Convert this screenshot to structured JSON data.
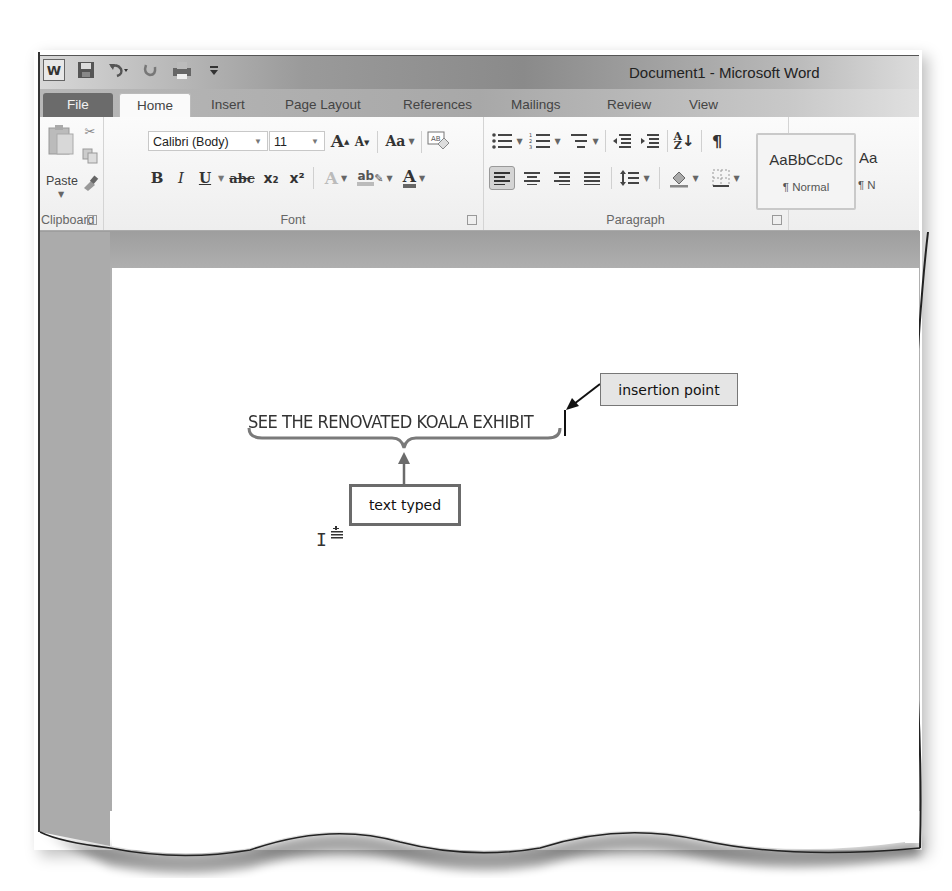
{
  "window": {
    "title": "Document1 - Microsoft Word",
    "quick_access": [
      "word-logo",
      "save",
      "undo",
      "redo",
      "print-preview",
      "customize"
    ],
    "word_logo_letter": "W"
  },
  "tabs": [
    {
      "label": "File",
      "active": false
    },
    {
      "label": "Home",
      "active": true
    },
    {
      "label": "Insert",
      "active": false
    },
    {
      "label": "Page Layout",
      "active": false
    },
    {
      "label": "References",
      "active": false
    },
    {
      "label": "Mailings",
      "active": false
    },
    {
      "label": "Review",
      "active": false
    },
    {
      "label": "View",
      "active": false
    }
  ],
  "ribbon": {
    "clipboard": {
      "label": "Clipboard",
      "paste_label": "Paste",
      "icons": [
        "cut",
        "copy",
        "format-painter"
      ]
    },
    "font": {
      "label": "Font",
      "font_name": "Calibri (Body)",
      "font_size": "11",
      "grow_font": "A",
      "shrink_font": "A",
      "change_case": "Aa",
      "bold": "B",
      "italic": "I",
      "underline": "U",
      "strikethrough": "abc",
      "subscript": "x₂",
      "superscript": "x²",
      "text_effects": "A",
      "highlight": "ab",
      "font_color": "A"
    },
    "paragraph": {
      "label": "Paragraph",
      "pilcrow": "¶",
      "sort": "A↓Z",
      "active_alignment": "align-left"
    },
    "styles": {
      "sample": "AaBbCcDc",
      "name": "¶ Normal",
      "next_sample": "Aa",
      "next_name": "¶ N"
    }
  },
  "document": {
    "typed_text": "SEE THE RENOVATED KOALA EXHIBIT"
  },
  "callouts": {
    "insertion_point": "insertion point",
    "text_typed": "text typed"
  },
  "colors": {
    "frame": "#444444",
    "ribbon_bg": "#f4f4f4",
    "doc_bg": "#a9a9a9",
    "file_tab": "#6b6b6b"
  }
}
